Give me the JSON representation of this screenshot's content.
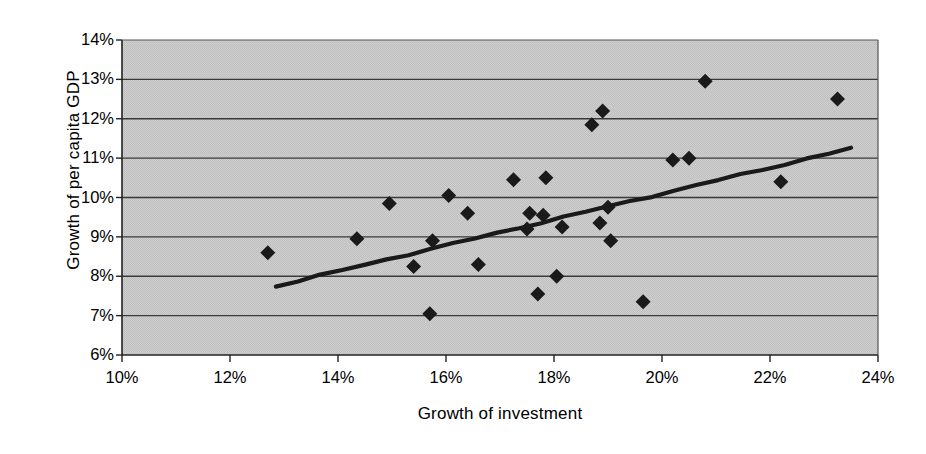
{
  "chart_data": {
    "type": "scatter",
    "title": "",
    "xlabel": "Growth of investment",
    "ylabel": "Growth of per capita GDP",
    "xlim": [
      10,
      24
    ],
    "ylim": [
      6,
      14
    ],
    "xticks": [
      "10%",
      "12%",
      "14%",
      "16%",
      "18%",
      "20%",
      "22%",
      "24%"
    ],
    "xtick_values": [
      10,
      12,
      14,
      16,
      18,
      20,
      22,
      24
    ],
    "yticks": [
      "6%",
      "7%",
      "8%",
      "9%",
      "10%",
      "11%",
      "12%",
      "13%",
      "14%"
    ],
    "ytick_values": [
      6,
      7,
      8,
      9,
      10,
      11,
      12,
      13,
      14
    ],
    "grid": "horizontal",
    "legend": "none",
    "plot_background": "#c9c9c9",
    "marker": "diamond",
    "marker_color": "#1a1a1a",
    "trendline_color": "#1a1a1a",
    "points": [
      {
        "x": 12.7,
        "y": 8.6
      },
      {
        "x": 14.35,
        "y": 8.95
      },
      {
        "x": 14.95,
        "y": 9.85
      },
      {
        "x": 15.4,
        "y": 8.25
      },
      {
        "x": 15.7,
        "y": 7.05
      },
      {
        "x": 15.75,
        "y": 8.9
      },
      {
        "x": 16.05,
        "y": 10.05
      },
      {
        "x": 16.4,
        "y": 9.6
      },
      {
        "x": 16.6,
        "y": 8.3
      },
      {
        "x": 17.25,
        "y": 10.45
      },
      {
        "x": 17.5,
        "y": 9.2
      },
      {
        "x": 17.55,
        "y": 9.6
      },
      {
        "x": 17.7,
        "y": 7.55
      },
      {
        "x": 17.8,
        "y": 9.55
      },
      {
        "x": 17.85,
        "y": 10.5
      },
      {
        "x": 18.05,
        "y": 8.0
      },
      {
        "x": 18.15,
        "y": 9.25
      },
      {
        "x": 18.7,
        "y": 11.85
      },
      {
        "x": 18.85,
        "y": 9.35
      },
      {
        "x": 18.9,
        "y": 12.2
      },
      {
        "x": 19.0,
        "y": 9.75
      },
      {
        "x": 19.05,
        "y": 8.9
      },
      {
        "x": 19.65,
        "y": 7.35
      },
      {
        "x": 20.2,
        "y": 10.95
      },
      {
        "x": 20.5,
        "y": 11.0
      },
      {
        "x": 20.8,
        "y": 12.95
      },
      {
        "x": 22.2,
        "y": 10.4
      },
      {
        "x": 23.25,
        "y": 12.5
      }
    ],
    "trendline": {
      "x0": 12.85,
      "y0": 7.75,
      "x1": 23.5,
      "y1": 11.25
    }
  }
}
